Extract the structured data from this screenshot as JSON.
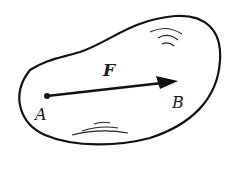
{
  "diagram": {
    "labels": {
      "force": "F",
      "point_a": "A",
      "point_b": "B"
    },
    "colors": {
      "stroke": "#111111",
      "background": "#ffffff"
    }
  }
}
